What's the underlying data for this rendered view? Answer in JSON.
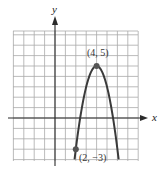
{
  "chart_data": {
    "type": "line",
    "title": "",
    "xlabel": "x",
    "ylabel": "y",
    "xlim": [
      -4,
      8
    ],
    "ylim": [
      -4,
      8.4
    ],
    "grid": true,
    "series": [
      {
        "name": "parabola",
        "equation": "y = -2(x - 4)^2 + 5",
        "x_range": [
          1.88,
          6.12
        ]
      }
    ],
    "points": [
      {
        "x": 4,
        "y": 5,
        "label": "(4, 5)"
      },
      {
        "x": 2,
        "y": -3,
        "label": "(2, −3)"
      }
    ],
    "colors": {
      "curve": "#3a3a3a",
      "grid": "#a9a9a9",
      "axis": "#2b2b2b"
    }
  }
}
